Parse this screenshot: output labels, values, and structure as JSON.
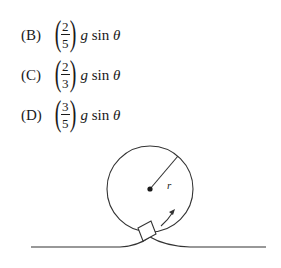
{
  "choices": [
    {
      "label": "(B)",
      "numerator": "2",
      "denominator": "5",
      "g": "g",
      "sin": "sin",
      "theta": "θ"
    },
    {
      "label": "(C)",
      "numerator": "2",
      "denominator": "3",
      "g": "g",
      "sin": "sin",
      "theta": "θ"
    },
    {
      "label": "(D)",
      "numerator": "3",
      "denominator": "5",
      "g": "g",
      "sin": "sin",
      "theta": "θ"
    }
  ],
  "diagram": {
    "radius_label": "r",
    "line_color": "#333333"
  }
}
